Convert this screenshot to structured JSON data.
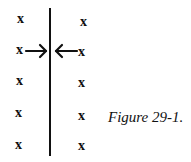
{
  "figure": {
    "caption": "Figure 29-1.",
    "mark_glyph": "x",
    "left_marks": [
      {
        "label": "x",
        "x": 17,
        "y": 12
      },
      {
        "label": "x",
        "x": 16,
        "y": 43
      },
      {
        "label": "x",
        "x": 16,
        "y": 74
      },
      {
        "label": "x",
        "x": 15,
        "y": 106
      },
      {
        "label": "x",
        "x": 15,
        "y": 138
      }
    ],
    "right_marks": [
      {
        "label": "x",
        "x": 80,
        "y": 15
      },
      {
        "label": "x",
        "x": 78,
        "y": 45
      },
      {
        "label": "x",
        "x": 78,
        "y": 76
      },
      {
        "label": "x",
        "x": 78,
        "y": 109
      },
      {
        "label": "x",
        "x": 78,
        "y": 139
      }
    ],
    "arrows": [
      {
        "direction": "right",
        "from_x": 26,
        "to_x": 46,
        "y": 51
      },
      {
        "direction": "left",
        "from_x": 77,
        "to_x": 56,
        "y": 51
      }
    ],
    "divider": {
      "orientation": "vertical",
      "x": 50
    }
  }
}
